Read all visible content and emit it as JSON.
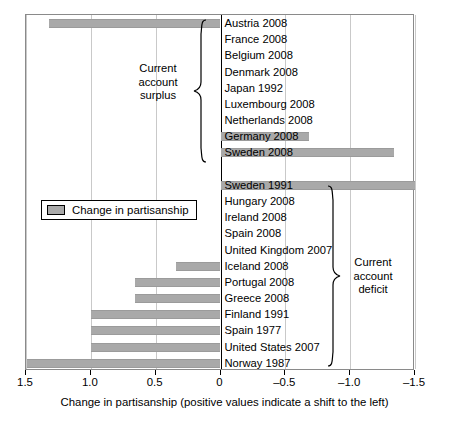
{
  "chart_data": {
    "type": "bar",
    "orientation": "horizontal",
    "title": "",
    "xlabel": "Change in partisanship (positive values indicate a shift to the left)",
    "ylabel": "",
    "xlim": [
      1.5,
      -1.5
    ],
    "xticks": [
      1.5,
      1.0,
      0.5,
      0,
      -0.5,
      -1.0,
      -1.5
    ],
    "xtick_labels": [
      "1.5",
      "1.0",
      "0.5",
      "0",
      "–0.5",
      "–1.0",
      "–1.5"
    ],
    "grid": "vertical",
    "bar_color": "#a9a9a9",
    "legend": {
      "position": "left-middle",
      "entries": [
        "Change in partisanship"
      ]
    },
    "categories": [
      "Austria 2008",
      "France 2008",
      "Belgium 2008",
      "Denmark 2008",
      "Japan 1992",
      "Luxembourg 2008",
      "Netherlands 2008",
      "Germany 2008",
      "Sweden 2008",
      "",
      "Sweden 1991",
      "Hungary 2008",
      "Ireland 2008",
      "Spain 2008",
      "United Kingdom 2007",
      "Iceland 2008",
      "Portugal 2008",
      "Greece 2008",
      "Finland 1991",
      "Spain 1977",
      "United States 2007",
      "Norway 1987"
    ],
    "values": [
      1.32,
      0.0,
      0.0,
      0.0,
      0.0,
      0.0,
      0.0,
      -0.68,
      -1.34,
      null,
      -1.5,
      0.0,
      0.0,
      0.0,
      0.0,
      0.34,
      0.66,
      0.66,
      1.0,
      1.0,
      1.0,
      1.49
    ],
    "annotations": [
      {
        "text": "Current account surplus",
        "lines": [
          "Current",
          "account",
          "surplus"
        ],
        "covers": "Austria 2008 – Sweden 2008"
      },
      {
        "text": "Current account deficit",
        "lines": [
          "Current",
          "account",
          "deficit"
        ],
        "covers": "Sweden 1991 – Norway 1987"
      }
    ]
  },
  "axis": {
    "xlabel": "Change in partisanship (positive values indicate a shift to the left)",
    "ticks": [
      {
        "label": "1.5",
        "value": 1.5
      },
      {
        "label": "1.0",
        "value": 1.0
      },
      {
        "label": "0.5",
        "value": 0.5
      },
      {
        "label": "0",
        "value": 0.0
      },
      {
        "label": "–0.5",
        "value": -0.5
      },
      {
        "label": "–1.0",
        "value": -1.0
      },
      {
        "label": "–1.5",
        "value": -1.5
      }
    ]
  },
  "legend": {
    "label": "Change in partisanship"
  },
  "annotations": {
    "surplus": {
      "line1": "Current",
      "line2": "account",
      "line3": "surplus"
    },
    "deficit": {
      "line1": "Current",
      "line2": "account",
      "line3": "deficit"
    }
  }
}
